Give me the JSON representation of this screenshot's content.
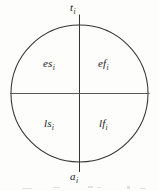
{
  "figure": {
    "shape": "circle",
    "stroke_color": "#2b2b2b",
    "background_color": "#fdfdfc",
    "geometry": {
      "center_x": 79,
      "center_y": 93,
      "radius": 68,
      "vertical_divider": "top-to-bottom diameter",
      "horizontal_divider": "left-to-right diameter"
    },
    "labels": {
      "top": {
        "base": "t",
        "sub": "i"
      },
      "bottom": {
        "base": "a",
        "sub": "i"
      },
      "upper_left": {
        "base": "es",
        "sub": "i"
      },
      "upper_right": {
        "base": "ef",
        "sub": "i"
      },
      "lower_left": {
        "base": "ls",
        "sub": "i"
      },
      "lower_right": {
        "base": "lf",
        "sub": "i"
      }
    }
  }
}
